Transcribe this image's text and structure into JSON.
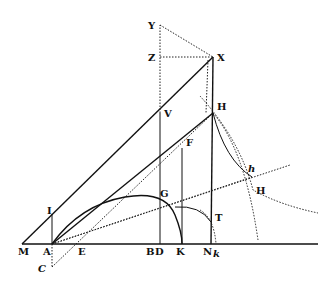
{
  "diagram": {
    "type": "geometric-construction",
    "style": "historical engraving, black ink on white",
    "colors": {
      "ink": "#111111",
      "background": "#ffffff"
    },
    "labels": [
      {
        "id": "Y",
        "text": "Y",
        "x": 148,
        "y": 29
      },
      {
        "id": "Z",
        "text": "Z",
        "x": 148,
        "y": 61
      },
      {
        "id": "X",
        "text": "X",
        "x": 217,
        "y": 61
      },
      {
        "id": "V",
        "text": "V",
        "x": 164,
        "y": 117
      },
      {
        "id": "H1",
        "text": "H",
        "x": 217,
        "y": 110
      },
      {
        "id": "F",
        "text": "F",
        "x": 186,
        "y": 146
      },
      {
        "id": "h",
        "text": "h",
        "x": 248,
        "y": 172
      },
      {
        "id": "H2",
        "text": "H",
        "x": 256,
        "y": 194
      },
      {
        "id": "G",
        "text": "G",
        "x": 160,
        "y": 197
      },
      {
        "id": "I",
        "text": "I",
        "x": 47,
        "y": 214
      },
      {
        "id": "T",
        "text": "T",
        "x": 215,
        "y": 221
      },
      {
        "id": "M",
        "text": "M",
        "x": 18,
        "y": 255
      },
      {
        "id": "A",
        "text": "A",
        "x": 43,
        "y": 255
      },
      {
        "id": "E",
        "text": "E",
        "x": 78,
        "y": 255
      },
      {
        "id": "B",
        "text": "B",
        "x": 146,
        "y": 255
      },
      {
        "id": "D",
        "text": "D",
        "x": 155,
        "y": 255
      },
      {
        "id": "K",
        "text": "K",
        "x": 176,
        "y": 255
      },
      {
        "id": "N",
        "text": "N",
        "x": 203,
        "y": 255
      },
      {
        "id": "k",
        "text": "k",
        "x": 213,
        "y": 257
      },
      {
        "id": "C",
        "text": "C",
        "x": 38,
        "y": 272
      }
    ]
  }
}
